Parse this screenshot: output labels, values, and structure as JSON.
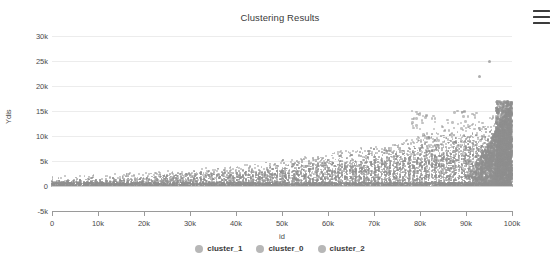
{
  "chart": {
    "title": "Clustering Results",
    "menu_icon": "hamburger-menu-icon"
  },
  "chart_data": {
    "type": "scatter",
    "title": "Clustering Results",
    "xlabel": "id",
    "ylabel": "Ydis",
    "xlim": [
      0,
      100000
    ],
    "ylim": [
      -5000,
      30000
    ],
    "grid": true,
    "legend_position": "bottom",
    "x_ticks": [
      0,
      10000,
      20000,
      30000,
      40000,
      50000,
      60000,
      70000,
      80000,
      90000,
      100000
    ],
    "x_tick_labels": [
      "0",
      "10k",
      "20k",
      "30k",
      "40k",
      "50k",
      "60k",
      "70k",
      "80k",
      "90k",
      "100k"
    ],
    "y_ticks": [
      -5000,
      0,
      5000,
      10000,
      15000,
      20000,
      25000,
      30000
    ],
    "y_tick_labels": [
      "-5k",
      "0",
      "5k",
      "10k",
      "15k",
      "20k",
      "25k",
      "30k"
    ],
    "series": [
      {
        "name": "cluster_1",
        "color": "#b7b7b7",
        "marker": "circle"
      },
      {
        "name": "cluster_0",
        "color": "#b7b7b7",
        "marker": "circle"
      },
      {
        "name": "cluster_2",
        "color": "#b7b7b7",
        "marker": "circle"
      }
    ],
    "notable_points": [
      {
        "x": 95000,
        "y": 25000,
        "note": "top outlier"
      },
      {
        "x": 93000,
        "y": 22000,
        "note": "second outlier"
      },
      {
        "x": 99000,
        "y": 17000,
        "note": "top of dense right cluster"
      }
    ]
  },
  "legend": {
    "items": [
      {
        "label": "cluster_1"
      },
      {
        "label": "cluster_0"
      },
      {
        "label": "cluster_2"
      }
    ]
  }
}
